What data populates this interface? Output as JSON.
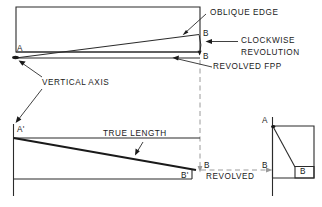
{
  "diagram": {
    "stroke_color": "#2b2b2b",
    "heavy_stroke_color": "#1a1a1a",
    "dashed_color": "#8c8c8c",
    "background": "#ffffff",
    "callouts": {
      "oblique_edge": "OBLIQUE EDGE",
      "clockwise": "CLOCKWISE",
      "revolution": "REVOLUTION",
      "revolved_fpp": "REVOLVED FPP",
      "vertical_axis": "VERTICAL AXIS",
      "true_length": "TRUE LENGTH",
      "revolved": "REVOLVED"
    },
    "points": {
      "a_top": "A",
      "b_oblique": "B",
      "b_revolved": "B",
      "a_front": "A'",
      "b_front": "B'",
      "b_dash": "B",
      "b_side_left": "B",
      "a_side": "A",
      "b_side_box": "B"
    }
  }
}
